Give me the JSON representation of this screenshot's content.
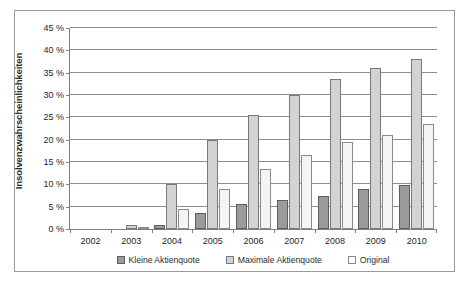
{
  "chart_data": {
    "type": "bar",
    "title": "",
    "xlabel": "",
    "ylabel": "Insolvenzwahrscheinlichkeiten",
    "categories": [
      "2002",
      "2003",
      "2004",
      "2005",
      "2006",
      "2007",
      "2008",
      "2009",
      "2010"
    ],
    "series": [
      {
        "name": "Kleine Aktienquote",
        "values": [
          0,
          0,
          1.0,
          3.5,
          5.5,
          6.5,
          7.5,
          9.0,
          9.8
        ],
        "color": "#9b9b9b"
      },
      {
        "name": "Maximale Aktienquote",
        "values": [
          0,
          1.0,
          10.0,
          20.0,
          25.5,
          30.0,
          33.5,
          36.0,
          38.0
        ],
        "color": "#d3d3d3"
      },
      {
        "name": "Original",
        "values": [
          0,
          0.5,
          4.5,
          9.0,
          13.5,
          16.5,
          19.5,
          21.0,
          23.5
        ],
        "color": "#f4f4f4"
      }
    ],
    "ylim": [
      0,
      45
    ],
    "ytick_values": [
      0,
      5,
      10,
      15,
      20,
      25,
      30,
      35,
      40,
      45
    ],
    "ytick_labels": [
      "0 %",
      "5 %",
      "10 %",
      "15 %",
      "20 %",
      "25 %",
      "30 %",
      "35 %",
      "40 %",
      "45 %"
    ],
    "grid": true,
    "legend_position": "bottom"
  }
}
